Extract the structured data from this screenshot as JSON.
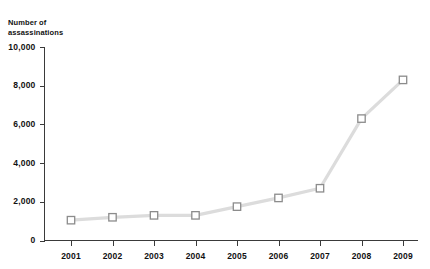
{
  "chart_data": {
    "type": "line",
    "title": "Number of assassinations",
    "title_lines": [
      "Number of",
      "assassinations"
    ],
    "xlabel": "",
    "ylabel": "Number of assassinations",
    "categories": [
      "2001",
      "2002",
      "2003",
      "2004",
      "2005",
      "2006",
      "2007",
      "2008",
      "2009"
    ],
    "values": [
      1050,
      1200,
      1300,
      1300,
      1750,
      2200,
      2700,
      6300,
      8300
    ],
    "series": [
      {
        "name": "Number of assassinations",
        "values": [
          1050,
          1200,
          1300,
          1300,
          1750,
          2200,
          2700,
          6300,
          8300
        ]
      }
    ],
    "ylim": [
      0,
      10000
    ],
    "ytick_labels": [
      "0",
      "2,000",
      "4,000",
      "6,000",
      "8,000",
      "10,000"
    ],
    "ytick_values": [
      0,
      2000,
      4000,
      6000,
      8000,
      10000
    ],
    "xtick_labels": [
      "2001",
      "2002",
      "2003",
      "2004",
      "2005",
      "2006",
      "2007",
      "2008",
      "2009"
    ],
    "grid": false,
    "legend": false,
    "legend_position": "none",
    "marker": "square",
    "colors": {
      "background": "#ffffff",
      "axis": "#3a3a3a",
      "line": "#dcdcdc",
      "marker_fill": "#ffffff",
      "marker_stroke": "#8c8c8c",
      "text": "#111111"
    }
  }
}
